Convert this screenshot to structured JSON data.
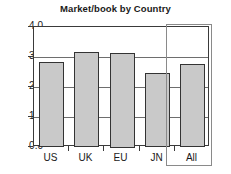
{
  "chart_data": {
    "type": "bar",
    "title": "Market/book by Country",
    "xlabel": "",
    "ylabel": "",
    "categories": [
      "US",
      "UK",
      "EU",
      "JN",
      "All"
    ],
    "values": [
      2.82,
      3.17,
      3.15,
      2.47,
      2.78
    ],
    "ylim": [
      0.0,
      4.0
    ],
    "ytick_labels": [
      "4.0",
      "3.0",
      "2.0",
      "1.0",
      "0.0"
    ],
    "ytick_values": [
      4.0,
      3.0,
      2.0,
      1.0,
      0.0
    ],
    "grid": true,
    "grid_axis": "y",
    "legend": "none",
    "bar_fill_color": "#c9c9c9",
    "bar_border_color": "#333333",
    "axis_color": "#3a3a3a",
    "grid_color": "#6e6e6e",
    "highlight_color": "#8a8a8a",
    "highlighted_category": "All",
    "annotations": []
  }
}
